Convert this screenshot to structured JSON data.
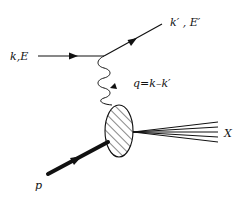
{
  "diagram": {
    "colors": {
      "line": "#111111",
      "background": "#ffffff"
    },
    "labels": {
      "incoming_lepton": "k,E",
      "outgoing_lepton": "k′ , E′",
      "photon": "q=k–k′",
      "proton": "p",
      "hadronic_final_state": "X"
    },
    "nodes": [
      {
        "id": "lepton-vertex",
        "x": 104,
        "y": 56
      },
      {
        "id": "hadron-blob",
        "cx": 119,
        "cy": 131,
        "rx": 14,
        "ry": 26,
        "fill": "hatched"
      }
    ],
    "edges": [
      {
        "from": "incoming",
        "to": "lepton-vertex",
        "style": "solid-arrow",
        "label": "k,E"
      },
      {
        "from": "lepton-vertex",
        "to": "outgoing",
        "style": "solid-arrow",
        "label": "k′ , E′"
      },
      {
        "from": "lepton-vertex",
        "to": "hadron-blob",
        "style": "wavy-arrow",
        "label": "q=k–k′"
      },
      {
        "from": "proton",
        "to": "hadron-blob",
        "style": "thick-arrow",
        "label": "p"
      },
      {
        "from": "hadron-blob",
        "to": "X",
        "style": "fan-of-lines",
        "count": 5,
        "label": "X"
      }
    ]
  }
}
